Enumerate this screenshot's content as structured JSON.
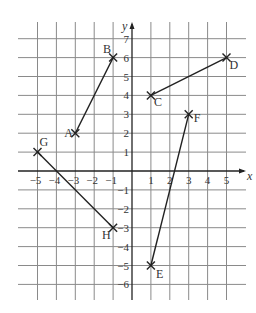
{
  "diagram": {
    "type": "coordinate-grid",
    "axes": {
      "x_label": "x",
      "y_label": "y",
      "x_range": [
        -5,
        5
      ],
      "y_range": [
        -6,
        7
      ],
      "x_ticks": [
        "-5",
        "-4",
        "-3",
        "-2",
        "-1",
        "1",
        "2",
        "3",
        "4",
        "5"
      ],
      "y_ticks": [
        "7",
        "6",
        "5",
        "4",
        "3",
        "2",
        "1",
        "-1",
        "-2",
        "-3",
        "-4",
        "-5",
        "-6"
      ]
    },
    "points": [
      {
        "name": "A",
        "x": -3,
        "y": 2
      },
      {
        "name": "B",
        "x": -1,
        "y": 6
      },
      {
        "name": "C",
        "x": 1,
        "y": 4
      },
      {
        "name": "D",
        "x": 5,
        "y": 6
      },
      {
        "name": "E",
        "x": 1,
        "y": -5
      },
      {
        "name": "F",
        "x": 3,
        "y": 3
      },
      {
        "name": "G",
        "x": -5,
        "y": 1
      },
      {
        "name": "H",
        "x": -1,
        "y": -3
      }
    ],
    "segments": [
      {
        "from": "A",
        "to": "B"
      },
      {
        "from": "C",
        "to": "D"
      },
      {
        "from": "E",
        "to": "F"
      },
      {
        "from": "G",
        "to": "H"
      }
    ],
    "colors": {
      "grid": "#8a8a8a",
      "axis": "#222222",
      "segment": "#222222",
      "text": "#333333"
    }
  }
}
